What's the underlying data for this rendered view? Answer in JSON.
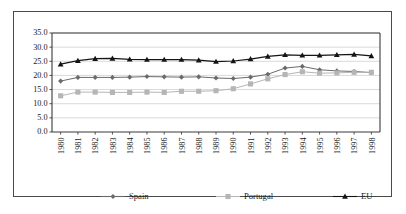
{
  "chart_data": {
    "type": "line",
    "title": "",
    "subtitle": "",
    "xlabel": "",
    "ylabel": "",
    "grid": true,
    "legend_position": "bottom",
    "ylim": [
      0.0,
      35.0
    ],
    "yticks": [
      "0.0",
      "5.0",
      "10.0",
      "15.0",
      "20.0",
      "25.0",
      "30.0",
      "35.0"
    ],
    "ytick_values": [
      0.0,
      5.0,
      10.0,
      15.0,
      20.0,
      25.0,
      30.0,
      35.0
    ],
    "categories": [
      "1980",
      "1981",
      "1982",
      "1983",
      "1984",
      "1985",
      "1986",
      "1987",
      "1988",
      "1989",
      "1990",
      "1991",
      "1992",
      "1993",
      "1994",
      "1995",
      "1996",
      "1997",
      "1998"
    ],
    "x": [
      1980,
      1981,
      1982,
      1983,
      1984,
      1985,
      1986,
      1987,
      1988,
      1989,
      1990,
      1991,
      1992,
      1993,
      1994,
      1995,
      1996,
      1997,
      1998
    ],
    "series": [
      {
        "name": "Spain",
        "color": "#6b6b6b",
        "marker": "diamond",
        "values": [
          18.0,
          19.3,
          19.3,
          19.3,
          19.4,
          19.6,
          19.5,
          19.4,
          19.5,
          19.1,
          18.9,
          19.4,
          20.4,
          22.6,
          23.2,
          22.0,
          21.6,
          21.4,
          21.0
        ]
      },
      {
        "name": "Portugal",
        "color": "#b5b5b5",
        "marker": "square",
        "values": [
          12.8,
          14.1,
          14.1,
          14.0,
          14.0,
          14.1,
          14.0,
          14.4,
          14.4,
          14.6,
          15.3,
          17.0,
          18.8,
          20.3,
          21.3,
          20.8,
          20.9,
          21.1,
          21.1
        ]
      },
      {
        "name": "EU",
        "color": "#141414",
        "marker": "triangle",
        "values": [
          24.0,
          25.2,
          25.9,
          26.0,
          25.7,
          25.6,
          25.6,
          25.6,
          25.4,
          24.9,
          25.1,
          25.8,
          26.7,
          27.3,
          27.1,
          27.1,
          27.3,
          27.4,
          26.9
        ]
      }
    ]
  },
  "legend": {
    "items": [
      {
        "label": "Spain"
      },
      {
        "label": "Portugal"
      },
      {
        "label": "EU"
      }
    ]
  }
}
